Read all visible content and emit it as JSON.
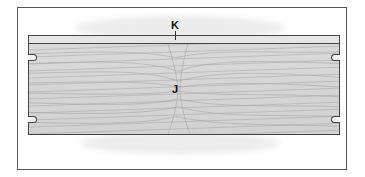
{
  "diagram": {
    "type": "wood panel with grain and mounting slots",
    "labels": {
      "top_edge": "K",
      "center_grain": "J"
    },
    "colors": {
      "frame_border": "#555555",
      "panel_fill": "#d6d6d6",
      "strip_fill": "#e6e6e6",
      "outline": "#444444"
    },
    "slots": [
      {
        "side": "left",
        "position": "top"
      },
      {
        "side": "left",
        "position": "bottom"
      },
      {
        "side": "right",
        "position": "top"
      },
      {
        "side": "right",
        "position": "bottom"
      }
    ]
  }
}
